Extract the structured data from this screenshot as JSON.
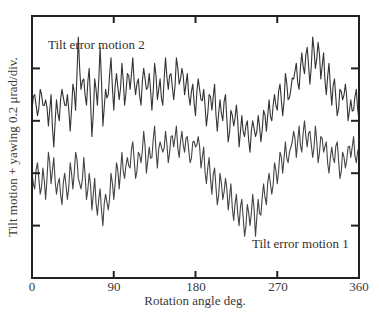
{
  "chart_data": {
    "type": "line",
    "title": "",
    "xlabel": "Rotation angle deg.",
    "ylabel": "Tilt motion + yawing 0.2 μrad/div.",
    "xlim": [
      0,
      360
    ],
    "ylim_divisions": [
      0,
      5
    ],
    "y_unit_per_division": "0.2 μrad",
    "x_ticks": [
      0,
      90,
      180,
      270,
      360
    ],
    "x_tick_labels": [
      "0",
      "90",
      "180",
      "270",
      "360"
    ],
    "y_ticks_divisions": [
      1,
      2,
      3,
      4
    ],
    "y_tick_labels": [],
    "grid": false,
    "legend": "inline annotations",
    "annotations": [
      {
        "text": "Tilt error motion 2",
        "near_series": "Tilt error motion 2",
        "position": "upper-left"
      },
      {
        "text": "Tilt error motion 1",
        "near_series": "Tilt error motion 1",
        "position": "lower-right"
      }
    ],
    "x": [
      0,
      3,
      6,
      9,
      12,
      15,
      18,
      21,
      24,
      27,
      30,
      33,
      36,
      39,
      42,
      45,
      48,
      51,
      54,
      57,
      60,
      63,
      66,
      69,
      72,
      75,
      78,
      81,
      84,
      87,
      90,
      93,
      96,
      99,
      102,
      105,
      108,
      111,
      114,
      117,
      120,
      123,
      126,
      129,
      132,
      135,
      138,
      141,
      144,
      147,
      150,
      153,
      156,
      159,
      162,
      165,
      168,
      171,
      174,
      177,
      180,
      183,
      186,
      189,
      192,
      195,
      198,
      201,
      204,
      207,
      210,
      213,
      216,
      219,
      222,
      225,
      228,
      231,
      234,
      237,
      240,
      243,
      246,
      249,
      252,
      255,
      258,
      261,
      264,
      267,
      270,
      273,
      276,
      279,
      282,
      285,
      288,
      291,
      294,
      297,
      300,
      303,
      306,
      309,
      312,
      315,
      318,
      321,
      324,
      327,
      330,
      333,
      336,
      339,
      342,
      345,
      348,
      351,
      354,
      357,
      360
    ],
    "series": [
      {
        "name": "Tilt error motion 2",
        "color": "#333333",
        "values_divisions": [
          3.2,
          3.5,
          3.1,
          3.6,
          3.3,
          3.4,
          2.9,
          3.5,
          2.5,
          3.4,
          3.0,
          3.6,
          3.3,
          3.5,
          2.8,
          3.7,
          3.2,
          4.6,
          3.6,
          3.8,
          3.3,
          4.0,
          2.7,
          3.8,
          3.3,
          4.4,
          2.9,
          3.6,
          3.5,
          4.2,
          3.2,
          3.9,
          3.4,
          4.1,
          3.3,
          3.9,
          3.6,
          4.2,
          3.5,
          3.8,
          3.3,
          4.0,
          3.6,
          3.9,
          3.2,
          4.1,
          3.4,
          3.8,
          3.3,
          4.2,
          3.6,
          3.9,
          3.4,
          4.2,
          3.7,
          4.0,
          3.5,
          3.9,
          3.3,
          3.7,
          3.1,
          3.8,
          3.4,
          3.6,
          2.9,
          3.5,
          3.2,
          3.7,
          2.8,
          3.4,
          3.0,
          3.5,
          2.6,
          3.2,
          2.9,
          3.3,
          2.5,
          3.1,
          2.7,
          3.0,
          2.4,
          3.0,
          2.7,
          3.1,
          2.6,
          3.2,
          2.8,
          3.4,
          3.0,
          3.5,
          3.2,
          3.7,
          3.1,
          3.9,
          3.4,
          3.6,
          3.8,
          4.1,
          3.6,
          4.3,
          3.9,
          4.4,
          3.7,
          4.6,
          4.0,
          4.5,
          3.8,
          4.3,
          3.5,
          4.1,
          3.3,
          3.8,
          3.1,
          3.6,
          3.4,
          3.7,
          3.0,
          3.4,
          3.2,
          3.6,
          3.0
        ]
      },
      {
        "name": "Tilt error motion 1",
        "color": "#444444",
        "values_divisions": [
          2.0,
          1.7,
          2.2,
          1.6,
          2.1,
          1.5,
          2.4,
          1.8,
          2.3,
          1.6,
          1.9,
          1.4,
          2.0,
          1.5,
          2.2,
          1.7,
          2.4,
          1.9,
          1.7,
          2.3,
          1.5,
          2.0,
          1.3,
          1.9,
          1.2,
          1.7,
          1.0,
          1.6,
          1.3,
          2.0,
          1.5,
          2.2,
          1.7,
          2.4,
          1.9,
          2.3,
          2.1,
          2.6,
          1.9,
          2.4,
          2.2,
          2.8,
          2.0,
          2.5,
          2.3,
          2.9,
          2.1,
          2.6,
          2.4,
          2.8,
          2.2,
          2.7,
          2.5,
          2.9,
          2.3,
          2.8,
          2.4,
          2.7,
          2.2,
          2.6,
          2.5,
          2.7,
          2.1,
          2.5,
          1.8,
          2.3,
          1.6,
          2.1,
          1.4,
          2.0,
          1.5,
          1.9,
          1.3,
          1.8,
          1.1,
          1.6,
          1.0,
          1.5,
          0.8,
          1.4,
          1.0,
          1.6,
          0.8,
          1.5,
          1.2,
          1.8,
          1.4,
          2.0,
          1.6,
          2.2,
          1.8,
          2.4,
          2.0,
          2.6,
          2.2,
          2.5,
          2.8,
          2.3,
          2.9,
          2.4,
          3.0,
          2.5,
          2.8,
          2.3,
          2.9,
          2.2,
          2.7,
          2.4,
          2.6,
          2.0,
          2.5,
          2.2,
          2.6,
          1.9,
          2.4,
          2.1,
          2.5,
          2.3,
          2.7,
          2.2,
          2.5
        ]
      }
    ]
  },
  "labels": {
    "series2": "Tilt error motion 2",
    "series1": "Tilt error motion 1",
    "xlabel": "Rotation angle deg.",
    "ylabel": "Tilt motion + yawing 0.2 μrad/div.",
    "xticks": [
      "0",
      "90",
      "180",
      "270",
      "360"
    ]
  }
}
